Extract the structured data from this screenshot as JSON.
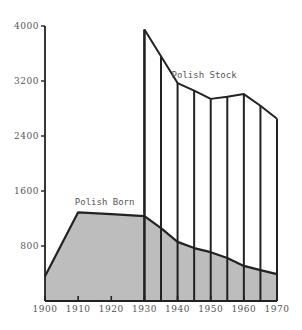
{
  "chart_data": {
    "type": "area",
    "title": "",
    "xlabel": "",
    "ylabel": "",
    "xlim": [
      1900,
      1970
    ],
    "ylim": [
      0,
      4000
    ],
    "grid": false,
    "legend": "inline labels",
    "x_ticks": [
      "1900",
      "1910",
      "1920",
      "1930",
      "1940",
      "1950",
      "1960",
      "1970"
    ],
    "y_ticks": [
      "800",
      "1600",
      "2400",
      "3200",
      "4000"
    ],
    "series": [
      {
        "name": "Polish Born",
        "style": "filled area (gray)",
        "x": [
          1900,
          1910,
          1920,
          1930,
          1935,
          1940,
          1945,
          1950,
          1955,
          1960,
          1965,
          1970
        ],
        "values": [
          360,
          1290,
          1265,
          1235,
          1060,
          860,
          770,
          710,
          625,
          510,
          450,
          390
        ]
      },
      {
        "name": "Polish Stock",
        "style": "line with vertical bars",
        "x": [
          1930,
          1935,
          1940,
          1945,
          1950,
          1955,
          1960,
          1965,
          1970
        ],
        "values": [
          3950,
          3560,
          3170,
          3060,
          2940,
          2970,
          3010,
          2840,
          2650
        ]
      }
    ],
    "annotations": [
      {
        "text": "Polish Born",
        "x": 1918,
        "y": 1400
      },
      {
        "text": "Polish Stock",
        "x": 1948,
        "y": 3250
      }
    ]
  },
  "colors": {
    "fill": "#bdbdbd",
    "line": "#222222",
    "text": "#555555"
  }
}
